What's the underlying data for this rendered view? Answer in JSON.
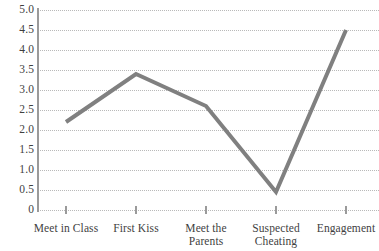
{
  "chart_data": {
    "type": "line",
    "title": "",
    "subtitle": "",
    "xlabel": "",
    "ylabel": "",
    "categories": [
      "Meet in Class",
      "First Kiss",
      "Meet the\nParents",
      "Suspected\nCheating",
      "Engagement"
    ],
    "values": [
      2.2,
      3.4,
      2.6,
      0.45,
      4.5
    ],
    "series": [
      {
        "name": "",
        "values": [
          2.2,
          3.4,
          2.6,
          0.45,
          4.5
        ]
      }
    ],
    "ylim": [
      0,
      5.0
    ],
    "ytick_values": [
      0,
      0.5,
      1.0,
      1.5,
      2.0,
      2.5,
      3.0,
      3.5,
      4.0,
      4.5,
      5.0
    ],
    "ytick_labels": [
      "0",
      "0.5",
      "1.0",
      "1.5",
      "2.0",
      "2.5",
      "3.0",
      "3.5",
      "4.0",
      "4.5",
      "5.0"
    ],
    "grid": "horizontal-dotted",
    "legend": "none",
    "line_color": "#808080",
    "grid_color": "#b9b9b9",
    "axis_color": "#9a9a9a",
    "text_color": "#3f3f3f",
    "background": "#ffffff",
    "annotations": []
  }
}
